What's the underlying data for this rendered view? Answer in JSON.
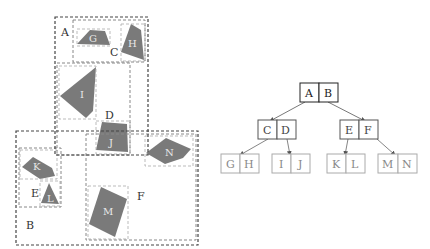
{
  "figure": {
    "type": "R-tree illustration",
    "left_panel": {
      "regions": [
        {
          "id": "A",
          "label": "A",
          "level": "root-entry"
        },
        {
          "id": "B",
          "label": "B",
          "level": "root-entry"
        },
        {
          "id": "C",
          "label": "C",
          "level": "internal"
        },
        {
          "id": "D",
          "label": "D",
          "level": "internal"
        },
        {
          "id": "E",
          "label": "E",
          "level": "internal"
        },
        {
          "id": "F",
          "label": "F",
          "level": "internal"
        }
      ],
      "objects": [
        {
          "id": "G",
          "label": "G"
        },
        {
          "id": "H",
          "label": "H"
        },
        {
          "id": "I",
          "label": "I"
        },
        {
          "id": "J",
          "label": "J"
        },
        {
          "id": "K",
          "label": "K"
        },
        {
          "id": "L",
          "label": "L"
        },
        {
          "id": "M",
          "label": "M"
        },
        {
          "id": "N",
          "label": "N"
        }
      ]
    },
    "tree": {
      "root": {
        "entries": [
          "A",
          "B"
        ]
      },
      "level1": [
        {
          "entries": [
            "C",
            "D"
          ],
          "parent": "A"
        },
        {
          "entries": [
            "E",
            "F"
          ],
          "parent": "B"
        }
      ],
      "leaves": [
        {
          "entries": [
            "G",
            "H"
          ],
          "parent": "C"
        },
        {
          "entries": [
            "I",
            "J"
          ],
          "parent": "D"
        },
        {
          "entries": [
            "K",
            "L"
          ],
          "parent": "E"
        },
        {
          "entries": [
            "M",
            "N"
          ],
          "parent": "F"
        }
      ]
    },
    "colors": {
      "shape_fill": "#7a7a7a",
      "dark_dash": "#444444",
      "light_dash": "#9a9a9a",
      "root_border": "#222222",
      "mid_border": "#555555",
      "leaf_border": "#9a9a9a"
    }
  }
}
